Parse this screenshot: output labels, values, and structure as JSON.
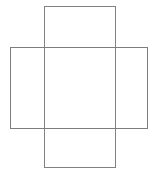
{
  "figure": {
    "background_color": "#ffffff",
    "canvas": {
      "width": 155,
      "height": 174
    },
    "stroke_color": "#808080",
    "stroke_width": 1,
    "fill": "none",
    "shapes": [
      {
        "name": "vertical-rectangle",
        "type": "rectangle",
        "orientation": "portrait",
        "x": 44.5,
        "y": 6.5,
        "width": 71,
        "height": 161,
        "stroke_color": "#808080",
        "stroke_width": 1,
        "fill": "none"
      },
      {
        "name": "horizontal-rectangle",
        "type": "rectangle",
        "orientation": "landscape",
        "x": 10.5,
        "y": 47.5,
        "width": 137,
        "height": 81,
        "stroke_color": "#7d7d7d",
        "stroke_width": 1,
        "fill": "none"
      }
    ]
  }
}
